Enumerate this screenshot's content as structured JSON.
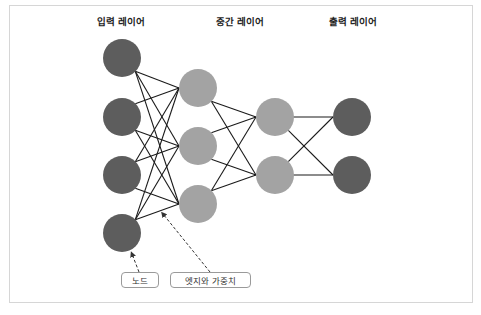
{
  "titles": {
    "input": "입력 레이어",
    "hidden": "중간 레이어",
    "output": "출력 레이어"
  },
  "labels": {
    "node": "노드",
    "edge_weight": "엣지와 가중치"
  },
  "colors": {
    "input_node": "#5d5d5d",
    "hidden_node": "#a3a3a3",
    "output_node": "#5d5d5d",
    "edge": "#1a1a1a",
    "annotation_arrow": "#333333",
    "frame_border": "#d6d6d6"
  },
  "network": {
    "layers": [
      {
        "name": "input",
        "x": 122,
        "ys": [
          58,
          117,
          175,
          233
        ]
      },
      {
        "name": "hidden1",
        "x": 198,
        "ys": [
          88,
          146,
          204
        ]
      },
      {
        "name": "hidden2",
        "x": 275,
        "ys": [
          117,
          175
        ]
      },
      {
        "name": "output",
        "x": 352,
        "ys": [
          117,
          175
        ]
      }
    ],
    "node_radius": 19
  }
}
